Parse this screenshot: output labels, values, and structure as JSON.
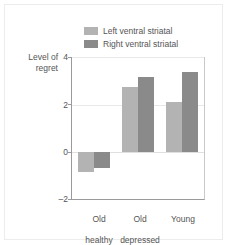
{
  "chart_data": {
    "type": "bar",
    "title": "",
    "xlabel": "",
    "ylabel": "Level of regret",
    "ylabel_line1": "Level of",
    "ylabel_line2": "regret",
    "ylim": [
      -2,
      4
    ],
    "yticks": [
      4,
      2,
      0,
      -2
    ],
    "ytick_labels": [
      "4",
      "2",
      "0",
      "–2"
    ],
    "grid": true,
    "legend_position": "top-center",
    "categories": [
      "Old healthy",
      "Old depressed",
      "Young"
    ],
    "category_lines": [
      [
        "Old",
        "healthy"
      ],
      [
        "Old",
        "depressed"
      ],
      [
        "Young",
        ""
      ]
    ],
    "series": [
      {
        "name": "Left ventral striatal",
        "color": "#b3b3b3",
        "values": [
          -0.85,
          2.75,
          2.1
        ]
      },
      {
        "name": "Right ventral striatal",
        "color": "#8a8a8a",
        "values": [
          -0.7,
          3.15,
          3.35
        ]
      }
    ]
  },
  "legend": {
    "items": [
      {
        "label": "Left ventral striatal",
        "color": "#b3b3b3"
      },
      {
        "label": "Right ventral striatal",
        "color": "#8a8a8a"
      }
    ]
  },
  "axis": {
    "y_label_line1": "Level of",
    "y_label_line2": "regret",
    "y_tick_4": "4",
    "y_tick_2": "2",
    "y_tick_0": "0",
    "y_tick_minus2": "–2",
    "x_tick_0_line1": "Old",
    "x_tick_0_line2": "healthy",
    "x_tick_1_line1": "Old",
    "x_tick_1_line2": "depressed",
    "x_tick_2_line1": "Young",
    "x_tick_2_line2": ""
  },
  "colors": {
    "series_left": "#b3b3b3",
    "series_right": "#8a8a8a",
    "axis": "#9a9a9a",
    "grid": "#e8e8e8",
    "text": "#555555",
    "frame": "#ececec",
    "background": "#ffffff"
  }
}
